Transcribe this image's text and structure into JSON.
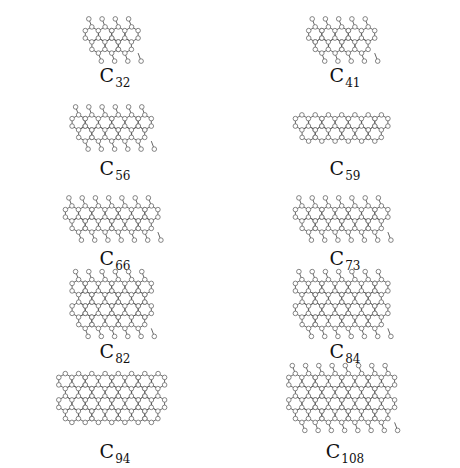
{
  "figure": {
    "molecules": [
      {
        "element": "C",
        "count": "32",
        "rings": 4,
        "rows": 1,
        "pendants": "alt"
      },
      {
        "element": "C",
        "count": "41",
        "rings": 5,
        "rows": 1,
        "pendants": "alt"
      },
      {
        "element": "C",
        "count": "56",
        "rings": 6,
        "rows": 1,
        "pendants": "both"
      },
      {
        "element": "C",
        "count": "59",
        "rings": 7,
        "rows": 1,
        "pendants": "none"
      },
      {
        "element": "C",
        "count": "66",
        "rings": 7,
        "rows": 1,
        "pendants": "alt"
      },
      {
        "element": "C",
        "count": "73",
        "rings": 7,
        "rows": 1,
        "pendants": "both"
      },
      {
        "element": "C",
        "count": "82",
        "rings": 6,
        "rows": 2,
        "pendants": "both"
      },
      {
        "element": "C",
        "count": "84",
        "rings": 7,
        "rows": 2,
        "pendants": "both"
      },
      {
        "element": "C",
        "count": "94",
        "rings": 8,
        "rows": 2,
        "pendants": "none"
      },
      {
        "element": "C",
        "count": "108",
        "rings": 8,
        "rows": 2,
        "pendants": "both"
      }
    ]
  }
}
